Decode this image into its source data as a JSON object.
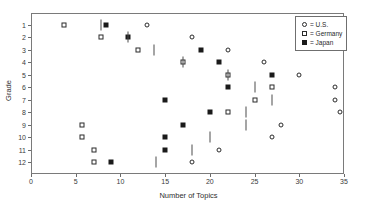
{
  "chart_data": {
    "type": "scatter",
    "title": "",
    "xlabel": "Number of Topics",
    "ylabel": "Grade",
    "xlim": [
      0,
      35
    ],
    "ylim": [
      1,
      12
    ],
    "grid": false,
    "legend_position": "top-right",
    "x_ticks": [
      0,
      5,
      10,
      15,
      20,
      25,
      30,
      35
    ],
    "x_tick_labels": [
      "0",
      "5",
      "10",
      "15",
      "20",
      "25",
      "30",
      "35"
    ],
    "y_ticks": [
      1,
      2,
      3,
      4,
      5,
      6,
      7,
      8,
      9,
      10,
      11,
      12
    ],
    "y_tick_labels": [
      "1",
      "2",
      "3",
      "4",
      "5",
      "6",
      "7",
      "8",
      "9",
      "10",
      "11",
      "12"
    ],
    "categories": [
      1,
      2,
      3,
      4,
      5,
      6,
      7,
      8,
      9,
      10,
      11,
      12
    ],
    "series": [
      {
        "name": "U.S.",
        "marker": "open-circle",
        "color": "#2b2b2b",
        "values": [
          13,
          18,
          22,
          26,
          30,
          34,
          34,
          34.5,
          28,
          27,
          21,
          18
        ]
      },
      {
        "name": "Germany",
        "marker": "open-square",
        "color": "#2b2b2b",
        "values": [
          3.7,
          7.8,
          12,
          17,
          22,
          27,
          25,
          22,
          5.7,
          5.7,
          7,
          7
        ]
      },
      {
        "name": "Japan",
        "marker": "filled-square",
        "color": "#1a1a1a",
        "values": [
          8.4,
          10.8,
          19,
          21,
          27,
          22,
          15,
          20,
          17,
          15,
          15,
          9
        ]
      },
      {
        "name": "Median bar",
        "marker": "vertical-bar",
        "color": "#4d4d4d",
        "values": [
          7.8,
          10.8,
          13.8,
          17,
          22,
          25,
          27,
          24,
          24,
          20,
          18,
          14
        ]
      }
    ]
  },
  "legend": {
    "entries": [
      {
        "symbol": "open-circle",
        "label": "= U.S."
      },
      {
        "symbol": "open-square",
        "label": "= Germany"
      },
      {
        "symbol": "filled-square",
        "label": "= Japan"
      }
    ]
  },
  "axes": {
    "x_title": "Number of Topics",
    "y_title": "Grade"
  }
}
